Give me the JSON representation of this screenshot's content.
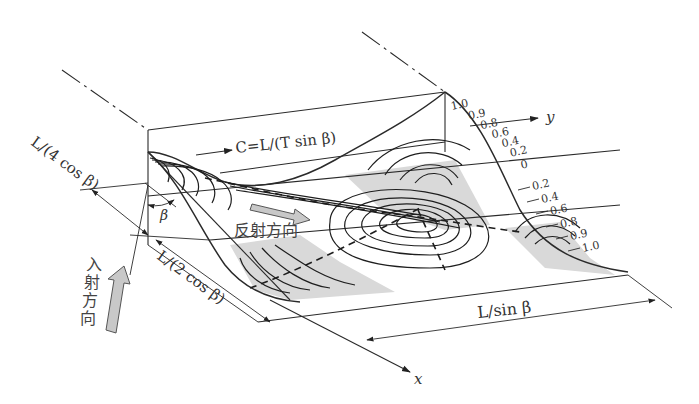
{
  "figure": {
    "axes": {
      "x_label": "x",
      "y_label": "y"
    },
    "celerity_label": "C=L/(T sin β)",
    "angle_label": "β",
    "dimensions": {
      "quarter": "L/(4 cos β)",
      "half": "L/(2 cos β)",
      "along_y": "L/sin β"
    },
    "incident_direction_label": "入射方向",
    "incident_chars": [
      "入",
      "射",
      "方",
      "向"
    ],
    "reflected_direction_label": "反射方向",
    "contour_levels_top": [
      "1.0",
      "0.9",
      "0.8",
      "0.6",
      "0.4",
      "0.2",
      "0"
    ],
    "contour_levels_bottom": [
      "0.2",
      "0.4",
      "0.6",
      "0.8",
      "0.9",
      "1.0"
    ],
    "colors": {
      "line": "#2a2a2a",
      "shade": "#d9d9d9",
      "arrow_fill": "#c8c8c8",
      "background": "#ffffff"
    }
  }
}
